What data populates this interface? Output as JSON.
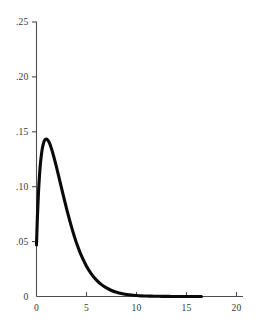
{
  "chart_data": {
    "type": "line",
    "title": "",
    "subtitle": "",
    "xlabel": "",
    "ylabel": "",
    "xlim": [
      0,
      21.5
    ],
    "ylim": [
      0,
      0.25
    ],
    "grid": false,
    "legend": null,
    "annotations": [],
    "x_ticks": [
      {
        "value": 0,
        "label": "0"
      },
      {
        "value": 5,
        "label": "5"
      },
      {
        "value": 10,
        "label": "10"
      },
      {
        "value": 15,
        "label": "15"
      },
      {
        "value": 20,
        "label": "20"
      }
    ],
    "y_ticks": [
      {
        "value": 0,
        "label": "0"
      },
      {
        "value": 0.05,
        "label": ".05"
      },
      {
        "value": 0.1,
        "label": ".10"
      },
      {
        "value": 0.15,
        "label": ".15"
      },
      {
        "value": 0.2,
        "label": ".20"
      },
      {
        "value": 0.25,
        "label": ".25"
      }
    ],
    "series": [
      {
        "name": "density",
        "color": "#0a0a0a",
        "x": [
          0,
          0.1,
          0.2,
          0.3,
          0.4,
          0.5,
          0.6,
          0.7,
          0.8,
          0.9,
          1.0,
          1.1,
          1.2,
          1.3,
          1.4,
          1.5,
          1.6,
          1.7,
          1.8,
          1.9,
          2.0,
          2.2,
          2.4,
          2.6,
          2.8,
          3.0,
          3.25,
          3.5,
          3.75,
          4.0,
          4.5,
          5.0,
          5.5,
          6.0,
          6.5,
          7.0,
          7.5,
          8.0,
          8.5,
          9.0,
          9.5,
          10.0,
          10.5,
          11.0,
          11.5,
          12.0,
          12.5,
          13.0,
          13.5,
          14.0,
          14.5,
          15.0,
          15.5,
          16.0,
          16.5
        ],
        "y": [
          0.047,
          0.0746,
          0.095,
          0.1103,
          0.1216,
          0.1298,
          0.1357,
          0.1396,
          0.142,
          0.1432,
          0.1434,
          0.1428,
          0.1415,
          0.1396,
          0.1373,
          0.1346,
          0.1316,
          0.1283,
          0.1249,
          0.1214,
          0.1178,
          0.1103,
          0.1027,
          0.0951,
          0.0876,
          0.0803,
          0.0716,
          0.0634,
          0.0558,
          0.0488,
          0.0369,
          0.0276,
          0.0204,
          0.0149,
          0.0108,
          0.0078,
          0.0055,
          0.0039,
          0.0027,
          0.0019,
          0.0013,
          0.0009,
          0.0006,
          0.0004,
          0.0003,
          0.0002,
          0.00013,
          9e-05,
          6e-05,
          4e-05,
          2e-05,
          2e-05,
          1e-05,
          1e-05,
          0.0
        ]
      }
    ],
    "peak": {
      "x": 1.9,
      "y": 0.181
    },
    "start_point": {
      "x": 0,
      "y": 0.048
    },
    "end_point": {
      "x": 16.5,
      "y": 0.0
    }
  },
  "axes": {
    "x_axis_name": "x-axis",
    "y_axis_name": "y-axis"
  }
}
